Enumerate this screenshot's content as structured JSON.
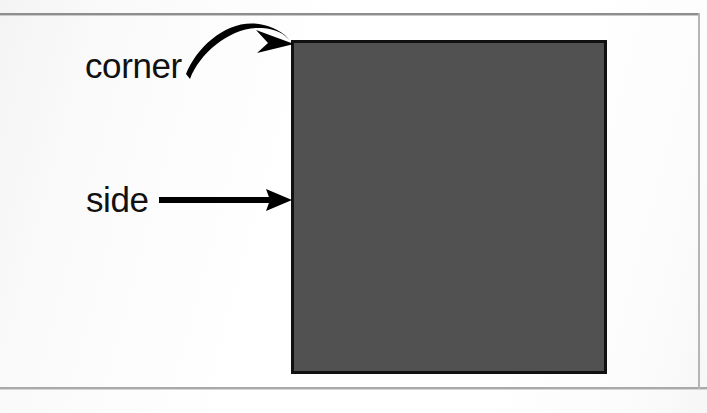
{
  "figure": {
    "background_color": "#fdfdfd",
    "page_rule_color": "#8e8e8e",
    "labels": [
      {
        "id": "corner",
        "text": "corner",
        "x": 85,
        "y": 48,
        "font_size": 35,
        "color": "#111111",
        "pointer": "curved-arrow"
      },
      {
        "id": "side",
        "text": "side",
        "x": 86,
        "y": 182,
        "font_size": 35,
        "color": "#111111",
        "pointer": "straight-arrow"
      }
    ],
    "shape": {
      "name": "square",
      "fill_color": "#515151",
      "stroke_color": "#111111",
      "stroke_width": 3,
      "x": 291,
      "y": 40,
      "width": 316,
      "height": 334
    },
    "arrows": [
      {
        "id": "corner-arrow",
        "type": "curved",
        "color": "#000000",
        "start_x": 190,
        "start_y": 79,
        "control_x": 236,
        "control_y": 21,
        "end_x": 291,
        "end_y": 41,
        "target": "corner"
      },
      {
        "id": "side-arrow",
        "type": "straight",
        "color": "#000000",
        "start_x": 159,
        "start_y": 200,
        "end_x": 291,
        "end_y": 200,
        "target": "side"
      }
    ]
  }
}
